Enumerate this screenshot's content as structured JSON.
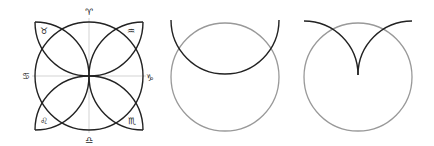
{
  "figures": [
    {
      "name": "zodiac-petal-diagram",
      "labels": {
        "top": "♈",
        "bottom": "♎",
        "left": "♋",
        "right": "♑",
        "upper_left": "♉",
        "upper_right": "♒",
        "lower_left": "♌",
        "lower_right": "♏"
      }
    },
    {
      "name": "circle-with-semicircle-arc"
    },
    {
      "name": "circle-with-cusp-arcs"
    }
  ],
  "colors": {
    "dark_stroke": "#222222",
    "gray_stroke": "#999999",
    "guide": "#c8c8c8"
  }
}
